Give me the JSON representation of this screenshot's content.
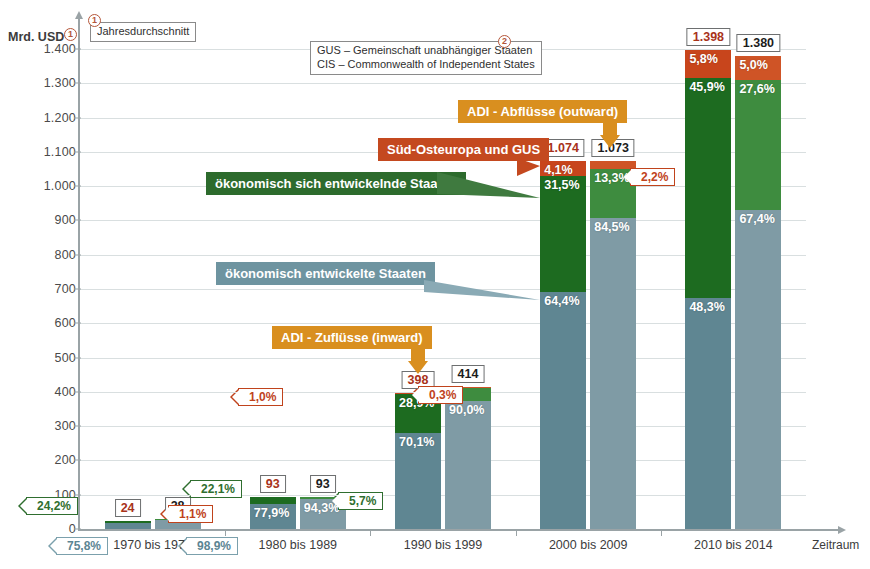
{
  "chart_data": {
    "type": "bar",
    "title": "",
    "ylabel": "Mrd. USD",
    "xlabel": "Zeitraum",
    "ylim": [
      0,
      1450
    ],
    "yticks": [
      "0",
      "100",
      "200",
      "300",
      "400",
      "500",
      "600",
      "700",
      "800",
      "900",
      "1.000",
      "1.100",
      "1.200",
      "1.300",
      "1.400"
    ],
    "grid": true,
    "categories": [
      "1970 bis 1979",
      "1980 bis 1989",
      "1990 bis 1999",
      "2000 bis 2009",
      "2010 bis 2014"
    ],
    "stack_order": [
      "ökonomisch entwickelte Staaten",
      "ökonomisch sich entwickelnde Staaten",
      "Süd-Osteuropa und GUS"
    ],
    "series": [
      {
        "name": "ADI - Zuflüsse (inward)",
        "totals": [
          24,
          93,
          398,
          1074,
          1398
        ],
        "total_labels": [
          "24",
          "93",
          "398",
          "1.074",
          "1.398"
        ],
        "shares": [
          {
            "developed": "75,8%",
            "developing": "24,2%",
            "see_cis": ""
          },
          {
            "developed": "77,9%",
            "developing": "22,1%",
            "see_cis": ""
          },
          {
            "developed": "70,1%",
            "developing": "28,9%",
            "see_cis": "1,0%"
          },
          {
            "developed": "64,4%",
            "developing": "31,5%",
            "see_cis": "4,1%"
          },
          {
            "developed": "48,3%",
            "developing": "45,9%",
            "see_cis": "5,8%"
          }
        ]
      },
      {
        "name": "ADI - Abflüsse (outward)",
        "totals": [
          28,
          93,
          414,
          1073,
          1380
        ],
        "total_labels": [
          "28",
          "93",
          "414",
          "1.073",
          "1.380"
        ],
        "shares": [
          {
            "developed": "98,9%",
            "developing": "1,1%",
            "see_cis": ""
          },
          {
            "developed": "94,3%",
            "developing": "5,7%",
            "see_cis": ""
          },
          {
            "developed": "90,0%",
            "developing": "9,7%",
            "see_cis": "0,3%"
          },
          {
            "developed": "84,5%",
            "developing": "13,3%",
            "see_cis": "2,2%"
          },
          {
            "developed": "67,4%",
            "developing": "27,6%",
            "see_cis": "5,0%"
          }
        ]
      }
    ],
    "colors": {
      "inward_developed": "#5f8692",
      "inward_developing": "#1d6b20",
      "inward_see_cis": "#c8451c",
      "outward_developed": "#7f9ba5",
      "outward_developing": "#3e8c3f",
      "outward_see_cis": "#cf5426",
      "banner_orange": "#d98f1f",
      "banner_red": "#c4491f",
      "banner_green": "#2d6b2d",
      "banner_blue": "#6e94a0"
    }
  },
  "callouts": {
    "inward_banner": "ADI - Zuflüsse (inward)",
    "outward_banner": "ADI - Abflüsse (outward)",
    "see_cis_banner": "Süd-Osteuropa und GUS",
    "developing_banner": "ökonomisch sich entwickelnde Staaten",
    "developed_banner": "ökonomisch entwickelte Staaten"
  },
  "footnotes": {
    "one_marker": "1",
    "two_marker": "2",
    "note1": "Jahresdurchschnitt",
    "note2": "GUS – Gemeinschaft unabhängiger Staaten\nCIS – Commonwealth of Independent States"
  },
  "labels": {
    "flag_1970_in_developing": "24,2%",
    "flag_1970_in_developed": "75,8%",
    "flag_1970_out_developing": "1,1%",
    "flag_1970_out_developed": "98,9%",
    "flag_1980_in_developing": "22,1%",
    "flag_1980_out_developing": "5,7%",
    "flag_1990_in_seecis": "1,0%",
    "flag_1990_out_seecis": "0,3%",
    "flag_2000_out_seecis": "2,2%"
  }
}
